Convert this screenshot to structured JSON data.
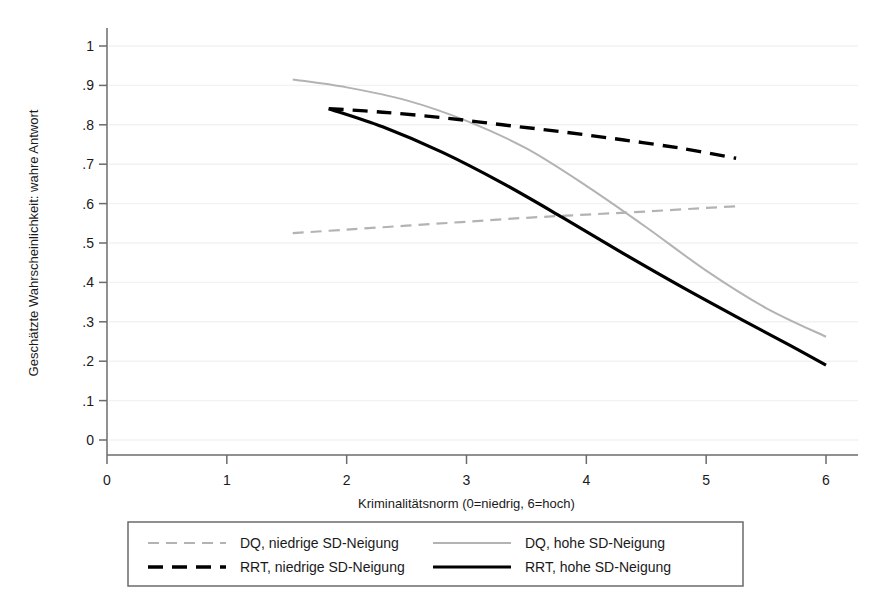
{
  "chart_data": {
    "type": "line",
    "title": "",
    "xlabel": "Kriminalitätsnorm (0=niedrig, 6=hoch)",
    "ylabel": "Geschätzte Wahrscheinlichkeit: wahre Antwort",
    "xlim": [
      0,
      6.2
    ],
    "ylim": [
      0,
      1.02
    ],
    "xticks": [
      "0",
      "1",
      "2",
      "3",
      "4",
      "5",
      "6"
    ],
    "xtick_values": [
      0,
      1,
      2,
      3,
      4,
      5,
      6
    ],
    "yticks": [
      "0",
      ".1",
      ".2",
      ".3",
      ".4",
      ".5",
      ".6",
      ".7",
      ".8",
      ".9",
      "1"
    ],
    "ytick_values": [
      0,
      0.1,
      0.2,
      0.3,
      0.4,
      0.5,
      0.6,
      0.7,
      0.8,
      0.9,
      1.0
    ],
    "grid": "horizontal-faint",
    "legend_position": "bottom",
    "series": [
      {
        "name": "DQ, niedrige SD-Neigung",
        "style": "dashed",
        "color": "#b3b3b3",
        "width": 2.2,
        "dash": "11,7",
        "points": [
          {
            "x": 1.55,
            "y": 0.525
          },
          {
            "x": 2.0,
            "y": 0.534
          },
          {
            "x": 2.5,
            "y": 0.544
          },
          {
            "x": 3.0,
            "y": 0.554
          },
          {
            "x": 3.5,
            "y": 0.564
          },
          {
            "x": 4.0,
            "y": 0.572
          },
          {
            "x": 4.5,
            "y": 0.58
          },
          {
            "x": 5.0,
            "y": 0.589
          },
          {
            "x": 5.25,
            "y": 0.593
          }
        ]
      },
      {
        "name": "DQ, hohe SD-Neigung",
        "style": "solid",
        "color": "#b3b3b3",
        "width": 2.0,
        "dash": "",
        "points": [
          {
            "x": 1.55,
            "y": 0.915
          },
          {
            "x": 2.0,
            "y": 0.895
          },
          {
            "x": 2.5,
            "y": 0.862
          },
          {
            "x": 3.0,
            "y": 0.81
          },
          {
            "x": 3.5,
            "y": 0.74
          },
          {
            "x": 4.0,
            "y": 0.645
          },
          {
            "x": 4.5,
            "y": 0.54
          },
          {
            "x": 5.0,
            "y": 0.43
          },
          {
            "x": 5.5,
            "y": 0.335
          },
          {
            "x": 6.0,
            "y": 0.262
          }
        ]
      },
      {
        "name": "RRT, niedrige SD-Neigung",
        "style": "dashed",
        "color": "#000000",
        "width": 3.4,
        "dash": "15,9",
        "points": [
          {
            "x": 1.85,
            "y": 0.841
          },
          {
            "x": 2.3,
            "y": 0.832
          },
          {
            "x": 2.8,
            "y": 0.818
          },
          {
            "x": 3.3,
            "y": 0.8
          },
          {
            "x": 3.8,
            "y": 0.782
          },
          {
            "x": 4.3,
            "y": 0.762
          },
          {
            "x": 4.8,
            "y": 0.74
          },
          {
            "x": 5.25,
            "y": 0.715
          }
        ]
      },
      {
        "name": "RRT, hohe SD-Neigung",
        "style": "solid",
        "color": "#000000",
        "width": 3.2,
        "dash": "",
        "points": [
          {
            "x": 1.85,
            "y": 0.841
          },
          {
            "x": 2.3,
            "y": 0.795
          },
          {
            "x": 2.8,
            "y": 0.73
          },
          {
            "x": 3.3,
            "y": 0.652
          },
          {
            "x": 3.8,
            "y": 0.565
          },
          {
            "x": 4.3,
            "y": 0.475
          },
          {
            "x": 4.8,
            "y": 0.388
          },
          {
            "x": 5.3,
            "y": 0.305
          },
          {
            "x": 5.7,
            "y": 0.24
          },
          {
            "x": 6.0,
            "y": 0.19
          }
        ]
      }
    ]
  },
  "legend": {
    "entries": [
      {
        "label": "DQ, niedrige SD-Neigung",
        "series_index": 0,
        "row": 0,
        "col": 0
      },
      {
        "label": "DQ, hohe SD-Neigung",
        "series_index": 1,
        "row": 0,
        "col": 1
      },
      {
        "label": "RRT, niedrige SD-Neigung",
        "series_index": 2,
        "row": 1,
        "col": 0
      },
      {
        "label": "RRT, hohe SD-Neigung",
        "series_index": 3,
        "row": 1,
        "col": 1
      }
    ]
  },
  "colors": {
    "axis": "#6b6b6b",
    "grid": "#f2f2f2",
    "text": "#1a1a1a",
    "legend_border": "#6b6b6b",
    "gray_series": "#b3b3b3",
    "black_series": "#000000"
  }
}
